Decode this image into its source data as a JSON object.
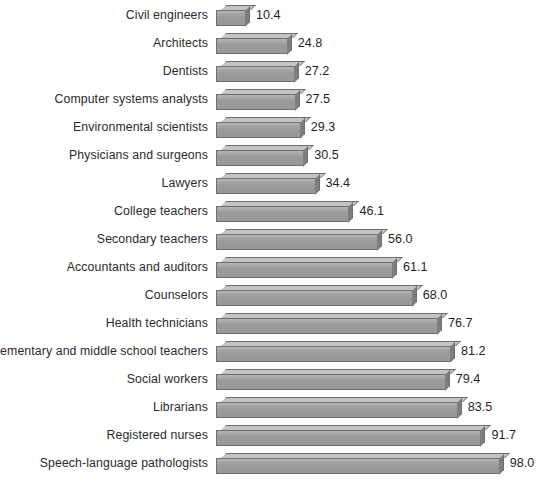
{
  "chart_data": {
    "type": "bar",
    "orientation": "horizontal",
    "title": "",
    "subtitle": "",
    "xlabel": "",
    "ylabel": "",
    "grid": false,
    "legend": false,
    "xlim": [
      0,
      98
    ],
    "value_format": "one-decimal",
    "categories": [
      "Civil engineers",
      "Architects",
      "Dentists",
      "Computer systems analysts",
      "Environmental scientists",
      "Physicians and surgeons",
      "Lawyers",
      "College teachers",
      "Secondary teachers",
      "Accountants and auditors",
      "Counselors",
      "Health technicians",
      "Elementary and middle school teachers",
      "Social workers",
      "Librarians",
      "Registered nurses",
      "Speech-language pathologists"
    ],
    "values": [
      10.4,
      24.8,
      27.2,
      27.5,
      29.3,
      30.5,
      34.4,
      46.1,
      56.0,
      61.1,
      68.0,
      76.7,
      81.2,
      79.4,
      83.5,
      91.7,
      98.0
    ],
    "value_labels": [
      "10.4",
      "24.8",
      "27.2",
      "27.5",
      "29.3",
      "30.5",
      "34.4",
      "46.1",
      "56.0",
      "61.1",
      "68.0",
      "76.7",
      "81.2",
      "79.4",
      "83.5",
      "91.7",
      "98.0"
    ],
    "bar_face_color": "#9a9a9a",
    "bar_top_color": "#c4c4c4",
    "bar_side_color": "#7d7d7d",
    "bar_outline_color": "#6f6f6f",
    "background_color": "#ffffff",
    "label_color": "#2b2b2b"
  }
}
